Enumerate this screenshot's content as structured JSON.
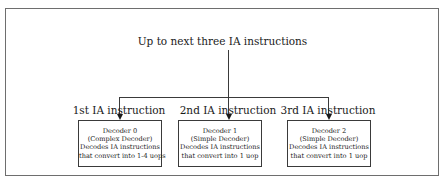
{
  "diagram": {
    "title": "Up to next three IA instructions",
    "decoders": [
      {
        "label": "1st IA instruction",
        "lines": [
          "Decoder 0",
          "(Complex Decoder)",
          "Decodes IA instructions",
          "that convert into 1-4 uops"
        ]
      },
      {
        "label": "2nd IA instruction",
        "lines": [
          "Decoder 1",
          "(Simple Decoder)",
          "Decodes IA instructions",
          "that convert into 1 uop"
        ]
      },
      {
        "label": "3rd IA instruction",
        "lines": [
          "Decoder 2",
          "(Simple Decoder)",
          "Decodes IA instructions",
          "that convert into 1 uop"
        ]
      }
    ]
  }
}
